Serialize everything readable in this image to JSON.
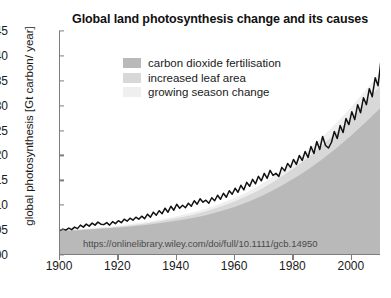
{
  "chart_data": {
    "type": "area",
    "title": "Global land photosynthesis change and its causes",
    "xlabel": "",
    "ylabel": "global photosynthesis [Gt carbon/ year]",
    "xlim": [
      1900,
      2010
    ],
    "ylim": [
      100,
      145
    ],
    "yticks": [
      100,
      105,
      110,
      115,
      120,
      125,
      130,
      135,
      140,
      145
    ],
    "xticks": [
      1900,
      1920,
      1940,
      1960,
      1980,
      2000
    ],
    "grid": false,
    "legend_position": "upper-left-inside",
    "annotation": "https://onlinelibrary.wiley.com/doi/full/10.1111/gcb.14950",
    "colors": {
      "carbon_dioxide_fertilisation": "#b9b9b9",
      "increased_leaf_area": "#d8d8d8",
      "growing_season_change": "#efefef",
      "total_line": "#111111",
      "axis": "#7d7d7d"
    },
    "series": [
      {
        "name": "carbon dioxide fertilisation",
        "stacked": true,
        "x": [
          1900,
          1905,
          1910,
          1915,
          1920,
          1925,
          1930,
          1935,
          1940,
          1945,
          1950,
          1955,
          1960,
          1965,
          1970,
          1975,
          1980,
          1985,
          1990,
          1995,
          2000,
          2005,
          2010
        ],
        "values": [
          104.8,
          104.9,
          105.1,
          105.3,
          105.5,
          105.8,
          106.1,
          106.5,
          106.9,
          107.4,
          108.0,
          108.8,
          109.7,
          110.8,
          112.1,
          113.6,
          115.3,
          117.2,
          119.3,
          121.6,
          124.1,
          126.8,
          129.6
        ]
      },
      {
        "name": "increased leaf area",
        "stacked": true,
        "x": [
          1900,
          1905,
          1910,
          1915,
          1920,
          1925,
          1930,
          1935,
          1940,
          1945,
          1950,
          1955,
          1960,
          1965,
          1970,
          1975,
          1980,
          1985,
          1990,
          1995,
          2000,
          2005,
          2010
        ],
        "values": [
          104.9,
          105.0,
          105.2,
          105.4,
          105.7,
          106.0,
          106.4,
          106.9,
          107.4,
          108.0,
          108.8,
          109.7,
          110.8,
          112.1,
          113.6,
          115.4,
          117.4,
          119.6,
          122.1,
          124.8,
          127.7,
          130.9,
          134.2
        ]
      },
      {
        "name": "growing season change",
        "stacked": true,
        "x": [
          1900,
          1905,
          1910,
          1915,
          1920,
          1925,
          1930,
          1935,
          1940,
          1945,
          1950,
          1955,
          1960,
          1965,
          1970,
          1975,
          1980,
          1985,
          1990,
          1995,
          2000,
          2005,
          2010
        ],
        "values": [
          105.0,
          105.1,
          105.3,
          105.6,
          105.9,
          106.3,
          106.7,
          107.2,
          107.8,
          108.5,
          109.3,
          110.3,
          111.5,
          112.9,
          114.6,
          116.5,
          118.7,
          121.1,
          123.8,
          126.7,
          129.9,
          133.3,
          136.9
        ]
      },
      {
        "name": "total photosynthesis",
        "type": "line",
        "x": [
          1900,
          1901,
          1902,
          1903,
          1904,
          1905,
          1906,
          1907,
          1908,
          1909,
          1910,
          1911,
          1912,
          1913,
          1914,
          1915,
          1916,
          1917,
          1918,
          1919,
          1920,
          1921,
          1922,
          1923,
          1924,
          1925,
          1926,
          1927,
          1928,
          1929,
          1930,
          1931,
          1932,
          1933,
          1934,
          1935,
          1936,
          1937,
          1938,
          1939,
          1940,
          1941,
          1942,
          1943,
          1944,
          1945,
          1946,
          1947,
          1948,
          1949,
          1950,
          1951,
          1952,
          1953,
          1954,
          1955,
          1956,
          1957,
          1958,
          1959,
          1960,
          1961,
          1962,
          1963,
          1964,
          1965,
          1966,
          1967,
          1968,
          1969,
          1970,
          1971,
          1972,
          1973,
          1974,
          1975,
          1976,
          1977,
          1978,
          1979,
          1980,
          1981,
          1982,
          1983,
          1984,
          1985,
          1986,
          1987,
          1988,
          1989,
          1990,
          1991,
          1992,
          1993,
          1994,
          1995,
          1996,
          1997,
          1998,
          1999,
          2000,
          2001,
          2002,
          2003,
          2004,
          2005,
          2006,
          2007,
          2008,
          2009,
          2010
        ],
        "values": [
          104.9,
          105.2,
          105.0,
          105.4,
          105.1,
          105.6,
          105.3,
          106.0,
          105.6,
          106.2,
          105.8,
          106.4,
          106.0,
          106.6,
          106.2,
          106.1,
          106.5,
          106.0,
          106.7,
          106.3,
          106.9,
          106.5,
          107.2,
          106.8,
          107.4,
          107.0,
          107.6,
          107.2,
          107.8,
          107.3,
          108.2,
          107.6,
          108.6,
          108.0,
          108.9,
          108.3,
          109.4,
          108.6,
          109.8,
          109.0,
          110.2,
          109.4,
          110.0,
          109.5,
          110.4,
          109.8,
          110.9,
          110.2,
          111.3,
          110.6,
          111.0,
          110.4,
          111.5,
          110.9,
          112.0,
          111.2,
          112.4,
          111.6,
          112.9,
          112.2,
          113.4,
          112.6,
          114.0,
          113.1,
          114.6,
          113.8,
          115.2,
          114.3,
          115.8,
          114.9,
          116.4,
          115.4,
          117.0,
          116.0,
          116.4,
          115.8,
          117.6,
          116.9,
          118.4,
          117.6,
          119.2,
          118.2,
          120.0,
          119.0,
          120.8,
          119.6,
          121.8,
          120.4,
          122.8,
          121.2,
          123.8,
          122.0,
          121.5,
          122.6,
          124.8,
          123.4,
          126.0,
          124.6,
          127.4,
          126.2,
          128.8,
          127.2,
          130.2,
          128.6,
          131.6,
          130.2,
          133.4,
          131.8,
          135.6,
          134.0,
          139.2
        ]
      }
    ]
  },
  "legend": {
    "items": [
      {
        "label": "carbon dioxide fertilisation",
        "color": "#b9b9b9"
      },
      {
        "label": "increased leaf area",
        "color": "#d8d8d8"
      },
      {
        "label": "growing season change",
        "color": "#efefef"
      }
    ]
  },
  "watermark": {
    "text": "https://onlinelibrary.wiley.com/doi/full/10.1111/gcb.14950"
  }
}
